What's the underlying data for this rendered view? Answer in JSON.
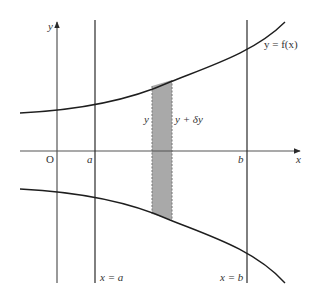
{
  "diagram": {
    "type": "volume-of-revolution-sketch",
    "colors": {
      "line": "#2a2a2a",
      "axis": "#555555",
      "strip_fill": "#a9a9a9",
      "strip_border": "#777777",
      "text": "#333333"
    },
    "labels": {
      "y_axis": "y",
      "x_axis": "x",
      "origin": "O",
      "a_tick": "a",
      "b_tick": "b",
      "curve": "y = f(x)",
      "line_a": "x = a",
      "line_b": "x = b",
      "strip_left": "y",
      "strip_right": "y + δy"
    },
    "elements": {
      "upper_curve": "y = f(x), increasing, concave up",
      "lower_curve": "reflection of f(x) in x-axis",
      "vertical_lines": [
        "x = a",
        "x = b"
      ],
      "shaded_strip": "thin strip of width δx between y and y + δy"
    }
  }
}
